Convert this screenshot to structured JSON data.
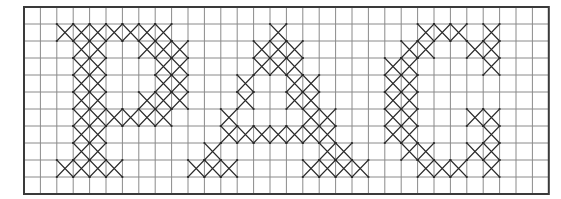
{
  "title": "Cross-stitch pattern chart",
  "letters_text": "PAO",
  "grid": {
    "columns": 32,
    "rows": 11,
    "origin_x": 24,
    "origin_y": 7,
    "cell_width": 16.4,
    "cell_height": 17,
    "background_color": "#ffffff",
    "grid_line_color": "#8a8a8a",
    "border_color": "#3a3a3a",
    "stitch_color": "#2a2a2a"
  },
  "letters": [
    {
      "name": "P",
      "cells": [
        [
          1,
          [
            2,
            3,
            4,
            5,
            6,
            7,
            8
          ]
        ],
        [
          2,
          [
            3,
            4,
            7,
            8,
            9
          ]
        ],
        [
          3,
          [
            3,
            4,
            8,
            9
          ]
        ],
        [
          4,
          [
            3,
            4,
            8,
            9
          ]
        ],
        [
          5,
          [
            3,
            4,
            7,
            8,
            9
          ]
        ],
        [
          6,
          [
            3,
            4,
            5,
            6,
            7,
            8
          ]
        ],
        [
          7,
          [
            3,
            4
          ]
        ],
        [
          8,
          [
            3,
            4
          ]
        ],
        [
          9,
          [
            2,
            3,
            4,
            5
          ]
        ]
      ]
    },
    {
      "name": "A",
      "cells": [
        [
          1,
          [
            15
          ]
        ],
        [
          2,
          [
            14,
            15,
            16
          ]
        ],
        [
          3,
          [
            14,
            15,
            16
          ]
        ],
        [
          4,
          [
            13,
            16,
            17
          ]
        ],
        [
          5,
          [
            13,
            16,
            17
          ]
        ],
        [
          6,
          [
            12,
            17,
            18
          ]
        ],
        [
          7,
          [
            12,
            13,
            14,
            15,
            16,
            17,
            18
          ]
        ],
        [
          8,
          [
            11,
            18,
            19
          ]
        ],
        [
          9,
          [
            10,
            11,
            12,
            17,
            18,
            19,
            20
          ]
        ]
      ]
    },
    {
      "name": "O",
      "cells": [
        [
          1,
          [
            24,
            25,
            26,
            28
          ]
        ],
        [
          2,
          [
            23,
            24,
            27,
            28
          ]
        ],
        [
          3,
          [
            22,
            23,
            28
          ]
        ],
        [
          4,
          [
            22,
            23
          ]
        ],
        [
          5,
          [
            22,
            23
          ]
        ],
        [
          6,
          [
            22,
            23,
            27,
            28
          ]
        ],
        [
          7,
          [
            22,
            23,
            28
          ]
        ],
        [
          8,
          [
            23,
            24,
            27,
            28
          ]
        ],
        [
          9,
          [
            24,
            25,
            26,
            28
          ]
        ]
      ]
    }
  ]
}
